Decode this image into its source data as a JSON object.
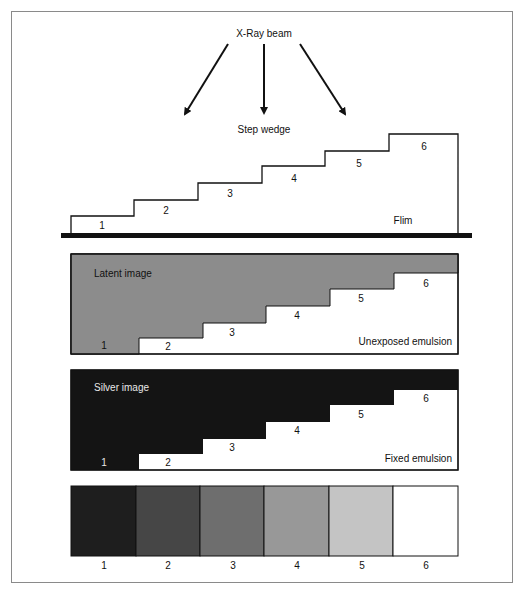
{
  "diagram": {
    "beam_label": "X-Ray beam",
    "wedge_label": "Step wedge",
    "film_label": "Flim",
    "steps": [
      "1",
      "2",
      "3",
      "4",
      "5",
      "6"
    ],
    "panels": {
      "latent": {
        "title": "Latent image",
        "note": "Unexposed emulsion",
        "fill": "#8c8c8c"
      },
      "silver": {
        "title": "Silver image",
        "note": "Fixed emulsion",
        "fill": "#141414"
      },
      "density": {
        "labels": [
          "1",
          "2",
          "3",
          "4",
          "5",
          "6"
        ],
        "fills": [
          "#1e1e1e",
          "#464646",
          "#6e6e6e",
          "#989898",
          "#c4c4c4",
          "#ffffff"
        ]
      }
    }
  }
}
